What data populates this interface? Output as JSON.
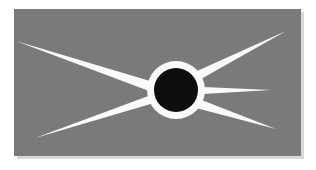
{
  "canvas": {
    "width": 316,
    "height": 170,
    "background_color": "#ffffff",
    "title": "Starburst Emblem"
  },
  "panel": {
    "name": "gray-panel",
    "fill_color": "#7a7a7a",
    "x": 14,
    "y": 9,
    "width": 287,
    "height": 147,
    "shadow_color": "#d8d8d8"
  },
  "core": {
    "name": "black-disc",
    "fill_color": "#0d0d0d",
    "center_x": 176,
    "center_y": 90,
    "radius": 22
  },
  "halo": {
    "name": "white-halo-ring",
    "fill_color": "#fafafa",
    "center_x": 176,
    "center_y": 90,
    "radius": 29,
    "ring_thickness": 7
  },
  "rays": {
    "fill_color": "#fafafa",
    "count": 5,
    "items": [
      {
        "name": "ray-upper-left",
        "label": "Upper left ray",
        "tip_x": 16,
        "tip_y": 42,
        "base_width": 10,
        "path": "M 16 41 L 150 81 L 149 91 Z"
      },
      {
        "name": "ray-lower-left",
        "label": "Lower left ray",
        "tip_x": 35,
        "tip_y": 137,
        "base_width": 9,
        "path": "M 35 138 L 151 95 L 154 103 Z"
      },
      {
        "name": "ray-upper-right",
        "label": "Upper right ray",
        "tip_x": 285,
        "tip_y": 32,
        "base_width": 9,
        "path": "M 286 31 L 201 79 L 197 71 Z"
      },
      {
        "name": "ray-middle-right",
        "label": "Middle right ray",
        "tip_x": 270,
        "tip_y": 90,
        "base_width": 6,
        "path": "M 271 90 L 203 94 L 203 87 Z"
      },
      {
        "name": "ray-lower-right",
        "label": "Lower right ray",
        "tip_x": 275,
        "tip_y": 128,
        "base_width": 9,
        "path": "M 276 129 L 199 99 L 196 108 Z"
      }
    ]
  }
}
